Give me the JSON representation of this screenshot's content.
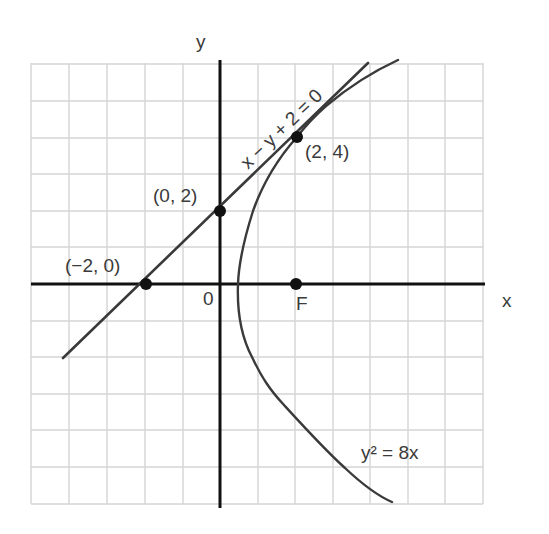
{
  "diagram": {
    "type": "coordinate-graph",
    "axes": {
      "x_label": "x",
      "y_label": "y",
      "origin_label": "0"
    },
    "grid": {
      "columns": 12,
      "rows": 12,
      "x_range": [
        -5,
        7
      ],
      "y_range": [
        -6,
        6
      ]
    },
    "curves": {
      "line": {
        "equation": "x − y + 2 = 0"
      },
      "parabola": {
        "equation": "y² = 8x"
      }
    },
    "points": [
      {
        "label": "(−2, 0)",
        "x": -2,
        "y": 0
      },
      {
        "label": "(0, 2)",
        "x": 0,
        "y": 2
      },
      {
        "label": "(2, 4)",
        "x": 2,
        "y": 4
      },
      {
        "label": "F",
        "x": 2,
        "y": 0
      }
    ],
    "colors": {
      "axis": "#111111",
      "curve": "#3a3a3a",
      "grid": "#d4d4d4",
      "text": "#3a3a3a"
    }
  }
}
